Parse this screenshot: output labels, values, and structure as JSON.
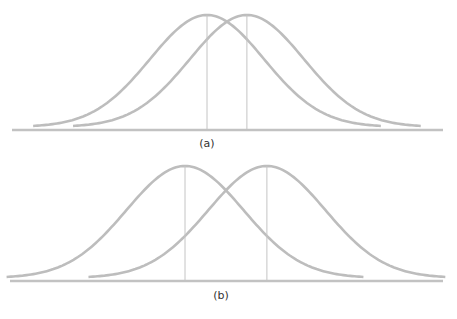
{
  "figure": {
    "colors": {
      "curve": "#bdbdbd",
      "mean_line": "#c4c4c4",
      "baseline": "#c2c2c2",
      "label": "#333333"
    }
  },
  "chart_data": [
    {
      "type": "line",
      "panel": "a",
      "label": "(a)",
      "description": "Two normal curves with equal spread and close means (large overlap)",
      "series": [
        {
          "name": "distribution-1",
          "mean": 0,
          "sd": 1
        },
        {
          "name": "distribution-2",
          "mean": 0.7,
          "sd": 1
        }
      ],
      "mean_lines": true,
      "x_range": [
        -3.05,
        3.05
      ],
      "y_range": [
        0,
        1
      ]
    },
    {
      "type": "line",
      "panel": "b",
      "label": "(b)",
      "description": "Two normal curves with equal spread and farther-apart means (smaller overlap)",
      "series": [
        {
          "name": "distribution-1",
          "mean": 0,
          "sd": 1
        },
        {
          "name": "distribution-2",
          "mean": 1.4,
          "sd": 1
        }
      ],
      "mean_lines": true,
      "x_range": [
        -3.05,
        3.05
      ],
      "y_range": [
        0,
        1
      ]
    }
  ]
}
